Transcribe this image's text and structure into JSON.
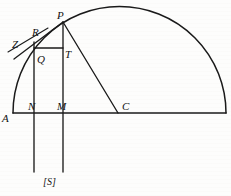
{
  "figure": {
    "kind": "geometry-diagram",
    "stroke_color": "#1a1a1a",
    "background_color": "#fdfdfc",
    "width": 231,
    "height": 196,
    "labels": [
      {
        "id": "label-P",
        "text": "P",
        "x": 57,
        "y": 10
      },
      {
        "id": "label-R",
        "text": "R",
        "x": 32,
        "y": 27
      },
      {
        "id": "label-Z",
        "text": "Z",
        "x": 12,
        "y": 39
      },
      {
        "id": "label-T",
        "text": "T",
        "x": 65,
        "y": 49
      },
      {
        "id": "label-Q",
        "text": "Q",
        "x": 37,
        "y": 54
      },
      {
        "id": "label-N",
        "text": "N",
        "x": 28,
        "y": 101
      },
      {
        "id": "label-M",
        "text": "M",
        "x": 57,
        "y": 101
      },
      {
        "id": "label-C",
        "text": "C",
        "x": 122,
        "y": 101
      },
      {
        "id": "label-A",
        "text": "A",
        "x": 2,
        "y": 113
      },
      {
        "id": "label-S",
        "text": "[S]",
        "x": 43,
        "y": 177
      }
    ],
    "points": {
      "A": {
        "x": 13,
        "y": 113
      },
      "B": {
        "x": 226,
        "y": 113
      },
      "C": {
        "x": 118,
        "y": 113
      },
      "N": {
        "x": 34,
        "y": 113
      },
      "M": {
        "x": 63,
        "y": 113
      },
      "P": {
        "x": 63,
        "y": 22
      },
      "T": {
        "x": 63,
        "y": 48
      },
      "Q": {
        "x": 34,
        "y": 48
      },
      "R": {
        "x": 40,
        "y": 35
      },
      "Z": {
        "x": 9,
        "y": 44
      }
    },
    "segments": [
      {
        "id": "baseline-AB",
        "from": "A",
        "to": "B"
      },
      {
        "id": "vertical-N",
        "from": "Nx",
        "to": "Ny"
      },
      {
        "id": "vertical-M",
        "from": "Mx",
        "to": "My"
      },
      {
        "id": "segment-QT",
        "from": "Q",
        "to": "T"
      },
      {
        "id": "segment-PC",
        "from": "P",
        "to": "C"
      },
      {
        "id": "segment-AR-chord",
        "from": "A",
        "to": "P"
      },
      {
        "id": "tangent-Z-R",
        "from": "Z",
        "to": "R"
      }
    ],
    "arc": {
      "id": "semicircle-arc",
      "center_x": 119.5,
      "center_y": 113,
      "radius": 106.5,
      "start_x": 13,
      "start_y": 113,
      "end_x": 226,
      "end_y": 113
    }
  }
}
